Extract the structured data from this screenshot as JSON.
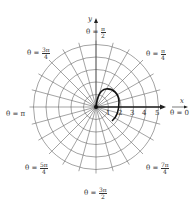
{
  "figure": {
    "type": "polar-graph",
    "axes": {
      "x_label": "x",
      "y_label": "y",
      "radial_ticks": [
        "1",
        "2",
        "3",
        "4",
        "5"
      ]
    },
    "angle_labels": [
      {
        "id": "theta-pi-over-2",
        "prefix": "θ =",
        "num": "π",
        "den": "2"
      },
      {
        "id": "theta-3pi-over-4",
        "prefix": "θ =",
        "num": "3π",
        "den": "4"
      },
      {
        "id": "theta-pi-over-4",
        "prefix": "θ =",
        "num": "π",
        "den": "4"
      },
      {
        "id": "theta-pi",
        "prefix": "θ = π"
      },
      {
        "id": "theta-0",
        "prefix": "θ = 0"
      },
      {
        "id": "theta-5pi-over-4",
        "prefix": "θ =",
        "num": "5π",
        "den": "4"
      },
      {
        "id": "theta-7pi-over-4",
        "prefix": "θ =",
        "num": "7π",
        "den": "4"
      },
      {
        "id": "theta-3pi-over-2",
        "prefix": "θ =",
        "num": "3π",
        "den": "2"
      }
    ],
    "colors": {
      "grid": "#555555",
      "curve": "#111111",
      "axis": "#222222"
    }
  }
}
